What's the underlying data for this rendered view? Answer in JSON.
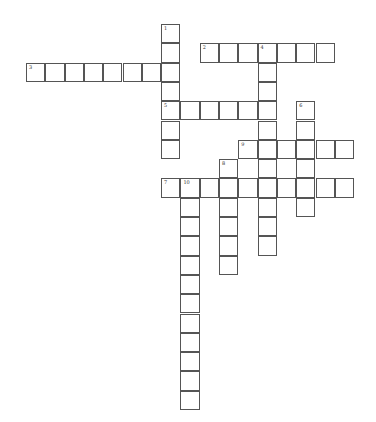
{
  "puzzle": {
    "origin": {
      "x": 26,
      "y": 24
    },
    "cell_size": 19.3,
    "colors": {
      "border": "#555555",
      "background": "#ffffff",
      "number": "#333333"
    },
    "entries": [
      {
        "number": "1",
        "direction": "down",
        "row": 0,
        "col": 7,
        "length": 7
      },
      {
        "number": "2",
        "direction": "across",
        "row": 1,
        "col": 9,
        "length": 7
      },
      {
        "number": "3",
        "direction": "across",
        "row": 2,
        "col": 0,
        "length": 8
      },
      {
        "number": "4",
        "direction": "down",
        "row": 1,
        "col": 12,
        "length": 11
      },
      {
        "number": "5",
        "direction": "across",
        "row": 4,
        "col": 7,
        "length": 6
      },
      {
        "number": "6",
        "direction": "down",
        "row": 4,
        "col": 14,
        "length": 6
      },
      {
        "number": "7",
        "direction": "across",
        "row": 8,
        "col": 7,
        "length": 10
      },
      {
        "number": "8",
        "direction": "down",
        "row": 7,
        "col": 10,
        "length": 6
      },
      {
        "number": "9",
        "direction": "across",
        "row": 6,
        "col": 11,
        "length": 6
      },
      {
        "number": "10",
        "direction": "down",
        "row": 8,
        "col": 8,
        "length": 12
      }
    ]
  }
}
